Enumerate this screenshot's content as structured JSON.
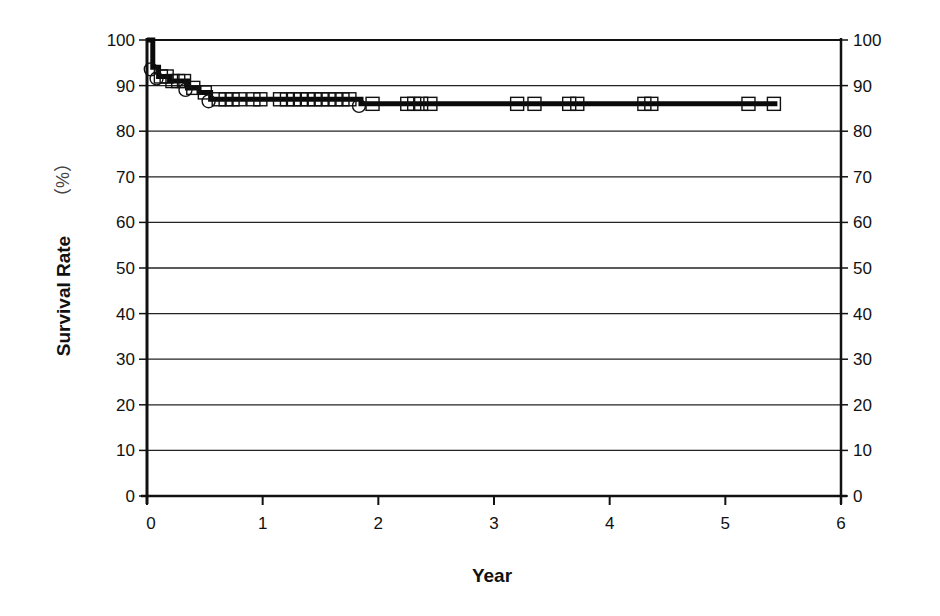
{
  "chart_data": {
    "type": "line",
    "subtype": "kaplan-meier-step",
    "title": "",
    "xlabel": "Year",
    "ylabel": "Survival Rate",
    "ylabel_unit": "（%）",
    "xlim": [
      0,
      6
    ],
    "ylim": [
      0,
      100
    ],
    "x_ticks": [
      0,
      1,
      2,
      3,
      4,
      5,
      6
    ],
    "y_ticks": [
      0,
      10,
      20,
      30,
      40,
      50,
      60,
      70,
      80,
      90,
      100
    ],
    "y_ticks_right": [
      0,
      10,
      20,
      30,
      40,
      50,
      60,
      70,
      80,
      90,
      100
    ],
    "grid": {
      "horizontal": true,
      "vertical": false
    },
    "legend": null,
    "series": [
      {
        "name": "Survival",
        "step_points": [
          {
            "x": 0.0,
            "y": 100
          },
          {
            "x": 0.05,
            "y": 94
          },
          {
            "x": 0.1,
            "y": 92
          },
          {
            "x": 0.2,
            "y": 91
          },
          {
            "x": 0.35,
            "y": 89.5
          },
          {
            "x": 0.45,
            "y": 88.5
          },
          {
            "x": 0.55,
            "y": 87
          },
          {
            "x": 1.85,
            "y": 86
          },
          {
            "x": 5.45,
            "y": 86
          }
        ],
        "event_markers_circle": [
          {
            "x": 0.05,
            "y": 94
          },
          {
            "x": 0.1,
            "y": 92
          },
          {
            "x": 0.35,
            "y": 89.5
          },
          {
            "x": 0.55,
            "y": 87
          },
          {
            "x": 1.85,
            "y": 86
          }
        ],
        "censor_markers_square": [
          {
            "x": 0.12,
            "y": 92
          },
          {
            "x": 0.17,
            "y": 92
          },
          {
            "x": 0.22,
            "y": 91
          },
          {
            "x": 0.27,
            "y": 91
          },
          {
            "x": 0.32,
            "y": 91
          },
          {
            "x": 0.4,
            "y": 89.5
          },
          {
            "x": 0.5,
            "y": 88.5
          },
          {
            "x": 0.62,
            "y": 87
          },
          {
            "x": 0.68,
            "y": 87
          },
          {
            "x": 0.74,
            "y": 87
          },
          {
            "x": 0.8,
            "y": 87
          },
          {
            "x": 0.92,
            "y": 87
          },
          {
            "x": 0.98,
            "y": 87
          },
          {
            "x": 1.15,
            "y": 87
          },
          {
            "x": 1.21,
            "y": 87
          },
          {
            "x": 1.27,
            "y": 87
          },
          {
            "x": 1.33,
            "y": 87
          },
          {
            "x": 1.39,
            "y": 87
          },
          {
            "x": 1.45,
            "y": 87
          },
          {
            "x": 1.51,
            "y": 87
          },
          {
            "x": 1.57,
            "y": 87
          },
          {
            "x": 1.63,
            "y": 87
          },
          {
            "x": 1.69,
            "y": 87
          },
          {
            "x": 1.75,
            "y": 87
          },
          {
            "x": 1.95,
            "y": 86
          },
          {
            "x": 2.25,
            "y": 86
          },
          {
            "x": 2.31,
            "y": 86
          },
          {
            "x": 2.37,
            "y": 86
          },
          {
            "x": 2.45,
            "y": 86
          },
          {
            "x": 3.2,
            "y": 86
          },
          {
            "x": 3.35,
            "y": 86
          },
          {
            "x": 3.65,
            "y": 86
          },
          {
            "x": 3.72,
            "y": 86
          },
          {
            "x": 4.3,
            "y": 86
          },
          {
            "x": 4.36,
            "y": 86
          },
          {
            "x": 5.2,
            "y": 86
          },
          {
            "x": 5.42,
            "y": 86
          }
        ]
      }
    ]
  },
  "axes": {
    "x_title": "Year",
    "y_title": "Survival Rate",
    "y_unit": "（%）"
  }
}
